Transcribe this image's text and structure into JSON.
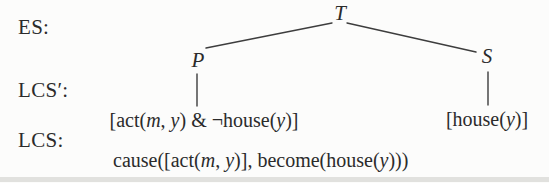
{
  "figure": {
    "row_labels": {
      "es": "ES:",
      "lcs_prime": "LCS′:",
      "lcs": "LCS:"
    },
    "tree": {
      "root": "T",
      "left_child": "P",
      "right_child": "S"
    },
    "formulas": {
      "p_lcs": {
        "parts": [
          "[act(",
          "m",
          ", ",
          "y",
          ") & ¬house(",
          "y",
          ")]"
        ]
      },
      "s_lcs": {
        "parts": [
          "[house(",
          "y",
          ")]"
        ]
      },
      "lcs_full": {
        "parts": [
          "cause([act(",
          "m",
          ", ",
          "y",
          ")], become(house(",
          "y",
          ")))"
        ]
      }
    },
    "colors": {
      "text": "#2b2b2b",
      "edge_line": "#3d3d3d",
      "background": "#fcfcfb",
      "scan_band": "#d9d9d7"
    }
  }
}
